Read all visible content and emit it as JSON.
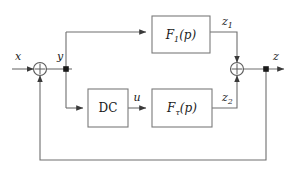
{
  "diagram": {
    "type": "control-system-block-diagram",
    "signals": {
      "input": "x",
      "after_sum": "y",
      "dc_output": "u",
      "upper_branch_output": "z",
      "upper_branch_output_sub": "1",
      "lower_branch_output": "z",
      "lower_branch_output_sub": "2",
      "output": "z"
    },
    "blocks": [
      {
        "id": "f1",
        "name": "F",
        "subscript": "1",
        "argument": "(p)",
        "label": "F1(p)"
      },
      {
        "id": "dc",
        "name": "DC",
        "subscript": "",
        "argument": "",
        "label": "DC"
      },
      {
        "id": "ftau",
        "name": "F",
        "subscript": "τ",
        "argument": "(p)",
        "label": "Fτ(p)"
      }
    ],
    "summing_junctions": [
      {
        "id": "sum-left",
        "symbol": "⊕",
        "inputs": [
          "x",
          "feedback"
        ],
        "output": "y"
      },
      {
        "id": "sum-right",
        "symbol": "⊕",
        "inputs": [
          "z1",
          "z2"
        ],
        "output": "z"
      }
    ],
    "feedback": {
      "from": "z",
      "to": "sum-left",
      "path": "bottom"
    },
    "colors": {
      "wire": "#6e6e6e",
      "box_stroke": "#7a7a7a",
      "text": "#1a1a1a",
      "background": "#ffffff",
      "node": "#1a1a1a"
    }
  }
}
